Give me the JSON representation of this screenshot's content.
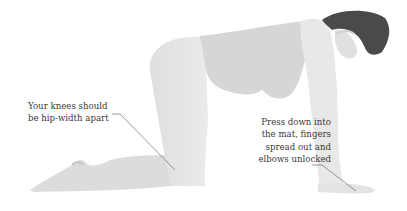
{
  "illustration": {
    "subject": "pregnant woman in tabletop (all-fours) yoga pose",
    "colors": {
      "background": "#ffffff",
      "body_light": "#ebebeb",
      "body_mid": "#d9d9d9",
      "body_shadow": "#c9c9c9",
      "hair": "#4a4a4a",
      "leader_line": "#6e6e6e",
      "text": "#3a3a3a"
    }
  },
  "top_caption": {
    "text": "(cut-off caption text at top edge)"
  },
  "annotations": [
    {
      "id": "knees",
      "lines": [
        "Your knees should",
        "be hip-width apart"
      ]
    },
    {
      "id": "hands",
      "lines": [
        "Press down into",
        "the mat, fingers",
        "spread out and",
        "elbows unlocked"
      ]
    }
  ]
}
